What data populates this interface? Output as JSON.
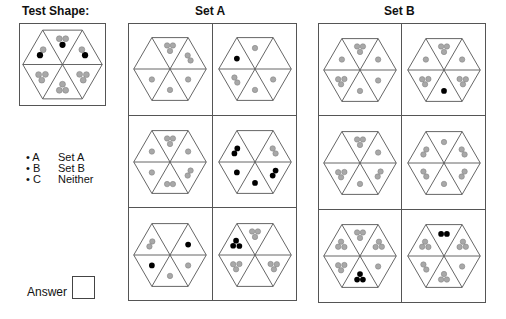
{
  "titles": {
    "test": "Test Shape:",
    "setA": "Set A",
    "setB": "Set B"
  },
  "legend": [
    {
      "key": "• A",
      "value": "Set A"
    },
    {
      "key": "• B",
      "value": "Set B"
    },
    {
      "key": "• C",
      "value": "Neither"
    }
  ],
  "answer": {
    "label": "Answer",
    "value": ""
  },
  "colors": {
    "grey_dot": "#a8a8a8",
    "black_dot": "#000000",
    "line": "#555555"
  },
  "note": "Triangle order: top, upper-right, lower-right, bottom, lower-left, upper-left. g=grey dot, b=black dot.",
  "test_shape": [
    "ggb",
    "bg",
    "ggg",
    "ggg",
    "ggg",
    "gb"
  ],
  "setA": [
    [
      "ggg",
      "gg",
      "g",
      "g",
      "g",
      ""
    ],
    [
      "g",
      "",
      "g",
      "g",
      "gg",
      "b"
    ],
    [
      "ggg",
      "g",
      "gg",
      "gg",
      "g",
      "g"
    ],
    [
      "",
      "gg",
      "bb",
      "b",
      "b",
      "bb"
    ],
    [
      "",
      "b",
      "g",
      "g",
      "b",
      "gg"
    ],
    [
      "ggg",
      "",
      "ggg",
      "",
      "ggg",
      "bbb"
    ]
  ],
  "setB": [
    [
      "ggg",
      "g",
      "g",
      "g",
      "ggg",
      "g"
    ],
    [
      "ggg",
      "g",
      "ggg",
      "b",
      "ggg",
      "g"
    ],
    [
      "ggg",
      "g",
      "gg",
      "g",
      "ggg",
      ""
    ],
    [
      "g",
      "gg",
      "gg",
      "g",
      "gg",
      "gg"
    ],
    [
      "ggg",
      "ggg",
      "g",
      "bbb",
      "ggg",
      "ggg"
    ],
    [
      "bb",
      "ggg",
      "g",
      "ggg",
      "gg",
      "ggg"
    ]
  ]
}
